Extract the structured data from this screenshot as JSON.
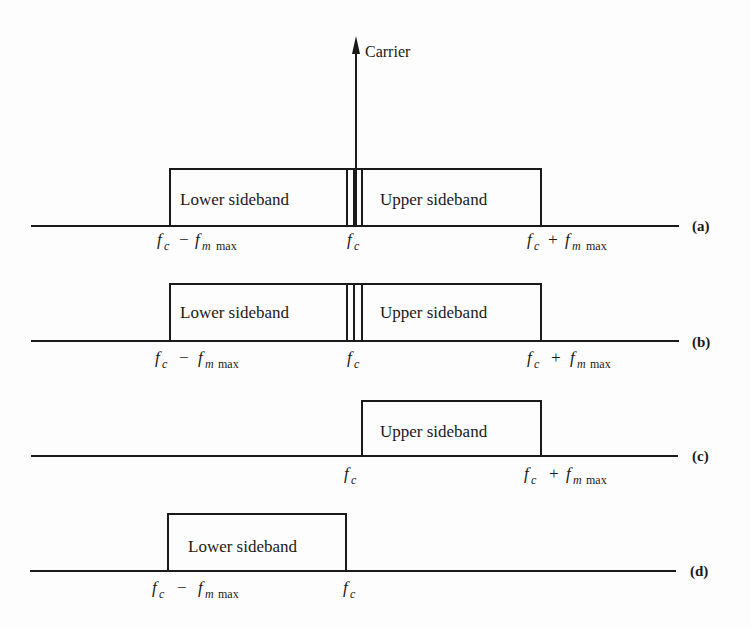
{
  "figure": {
    "title": "",
    "carrier_label": "Carrier",
    "panels": [
      {
        "id": "a",
        "tag": "(a)",
        "boxes": [
          {
            "label": "Lower sideband",
            "side": "lower"
          },
          {
            "label": "Upper sideband",
            "side": "upper"
          }
        ],
        "has_carrier": true,
        "has_center_gap_lines": true,
        "ticks": [
          {
            "main": "f",
            "sub": "c",
            "op": "−",
            "main2": "f",
            "sub2": "m",
            "sub2b": "max",
            "pos": "lower"
          },
          {
            "main": "f",
            "sub": "c",
            "pos": "center"
          },
          {
            "main": "f",
            "sub": "c",
            "op": "+",
            "main2": "f",
            "sub2": "m",
            "sub2b": "max",
            "pos": "upper"
          }
        ]
      },
      {
        "id": "b",
        "tag": "(b)",
        "boxes": [
          {
            "label": "Lower sideband",
            "side": "lower"
          },
          {
            "label": "Upper sideband",
            "side": "upper"
          }
        ],
        "has_carrier": false,
        "has_center_gap_lines": true
      },
      {
        "id": "c",
        "tag": "(c)",
        "boxes": [
          {
            "label": "Upper sideband",
            "side": "upper"
          }
        ],
        "has_carrier": false
      },
      {
        "id": "d",
        "tag": "(d)",
        "boxes": [
          {
            "label": "Lower sideband",
            "side": "lower"
          }
        ],
        "has_carrier": false
      }
    ],
    "labels": {
      "lower_sideband": "Lower sideband",
      "upper_sideband": "Upper sideband",
      "f": "f",
      "c": "c",
      "m": "m",
      "max": "max",
      "minus": "−",
      "plus": "+",
      "tag_a": "(a)",
      "tag_b": "(b)",
      "tag_c": "(c)",
      "tag_d": "(d)"
    }
  }
}
